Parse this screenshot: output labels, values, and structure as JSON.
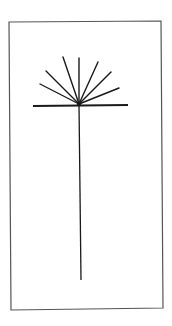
{
  "figure": {
    "colors": {
      "background": "#ffffff",
      "frame": "#555555",
      "stroke": "#1a1a1a"
    },
    "frame": {
      "points": "9,22 161,21 163,308 11,310"
    },
    "crossbar": {
      "x1": 33,
      "y1": 106,
      "x2": 128,
      "y2": 105,
      "width": 2
    },
    "stem": {
      "x1": 79,
      "y1": 104,
      "x2": 81,
      "y2": 280,
      "width": 1.3
    },
    "hub": {
      "cx": 79,
      "cy": 104,
      "r": 2.2
    },
    "rays": [
      {
        "x1": 79,
        "y1": 104,
        "x2": 40,
        "y2": 84
      },
      {
        "x1": 79,
        "y1": 104,
        "x2": 46,
        "y2": 71
      },
      {
        "x1": 79,
        "y1": 104,
        "x2": 63,
        "y2": 57
      },
      {
        "x1": 79,
        "y1": 104,
        "x2": 79,
        "y2": 58
      },
      {
        "x1": 79,
        "y1": 104,
        "x2": 98,
        "y2": 62
      },
      {
        "x1": 79,
        "y1": 104,
        "x2": 111,
        "y2": 72
      },
      {
        "x1": 79,
        "y1": 104,
        "x2": 119,
        "y2": 88
      }
    ]
  }
}
